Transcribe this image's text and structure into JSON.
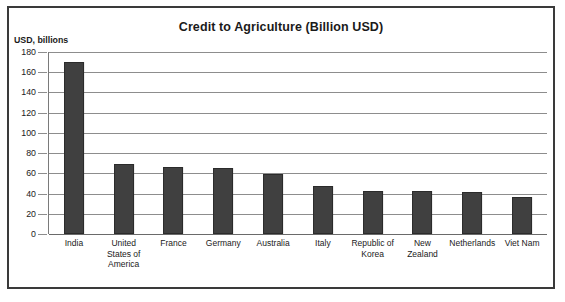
{
  "chart_data": {
    "type": "bar",
    "title": "Credit to Agriculture (Billion USD)",
    "xlabel": "",
    "ylabel": "USD, billions",
    "ylim": [
      0,
      180
    ],
    "ytick_step": 20,
    "yticks": [
      180,
      160,
      140,
      120,
      100,
      80,
      60,
      40,
      20,
      0
    ],
    "grid": true,
    "legend": false,
    "bar_color": "#404040",
    "categories": [
      "India",
      "United States of America",
      "France",
      "Germany",
      "Australia",
      "Italy",
      "Republic of Korea",
      "New Zealand",
      "Netherlands",
      "Viet Nam"
    ],
    "category_lines": [
      [
        "India"
      ],
      [
        "United",
        "States of",
        "America"
      ],
      [
        "France"
      ],
      [
        "Germany"
      ],
      [
        "Australia"
      ],
      [
        "Italy"
      ],
      [
        "Republic of",
        "Korea"
      ],
      [
        "New",
        "Zealand"
      ],
      [
        "Netherlands"
      ],
      [
        "Viet Nam"
      ]
    ],
    "values": [
      170,
      69,
      66,
      65,
      59,
      47,
      43,
      43,
      42,
      37
    ]
  },
  "colors": {
    "bar": "#404040",
    "bar_edge": "#2b2b2b",
    "gridline": "#8d8d8d",
    "frame": "#3a3a3a",
    "text": "#1a1a1a",
    "background": "#ffffff"
  }
}
